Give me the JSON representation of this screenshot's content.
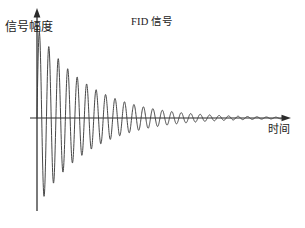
{
  "figure": {
    "title": "FID 信号",
    "background_color": "#ffffff",
    "line_color": "#3d3d3d",
    "axis_color": "#2b2b2b"
  },
  "axes": {
    "y_label": "信号幅度",
    "x_label": "时间",
    "x_arrow_icon": "arrow-right-icon",
    "y_arrow_icon": "arrow-up-icon"
  },
  "chart_data": {
    "type": "line",
    "title": "FID 信号",
    "xlabel": "时间",
    "ylabel": "信号幅度",
    "grid": false,
    "legend": null,
    "axis_origin_px": {
      "x": 37,
      "y": 118
    },
    "xlim": [
      0,
      26
    ],
    "ylim": [
      -1.05,
      1.05
    ],
    "model": {
      "form": "amplitude * exp(-t / tau) * sin(2*pi*t / period)",
      "amplitude": 1.0,
      "tau": 5.4,
      "period": 1.0,
      "t_start": 0,
      "t_end": 26,
      "samples": 1400
    },
    "x": [
      0.25,
      0.75,
      1.25,
      1.75,
      2.25,
      2.75,
      3.25,
      3.75,
      4.25,
      4.75,
      5.25,
      5.75,
      6.25,
      6.75,
      7.25,
      7.75,
      8.25,
      8.75,
      9.25,
      9.75,
      10.25,
      10.75,
      11.25,
      11.75,
      12.25,
      12.75,
      13.25,
      13.75,
      14.25,
      14.75,
      15.25,
      15.75,
      16.25,
      16.75,
      17.25,
      17.75,
      18.25,
      18.75,
      19.25,
      19.75,
      20.25,
      20.75,
      21.25,
      21.75,
      22.25,
      22.75,
      23.25,
      23.75,
      24.25,
      24.75,
      25.25,
      25.75
    ],
    "y": [
      0.955,
      -0.871,
      0.794,
      -0.724,
      0.661,
      -0.603,
      0.55,
      -0.501,
      0.457,
      -0.417,
      0.38,
      -0.347,
      0.317,
      -0.289,
      0.263,
      -0.24,
      0.219,
      -0.2,
      0.182,
      -0.166,
      0.152,
      -0.138,
      0.126,
      -0.115,
      0.105,
      -0.096,
      0.087,
      -0.08,
      0.073,
      -0.066,
      0.06,
      -0.055,
      0.05,
      -0.046,
      0.042,
      -0.038,
      0.035,
      -0.032,
      0.029,
      -0.026,
      0.024,
      -0.022,
      0.02,
      -0.018,
      0.016,
      -0.015,
      0.014,
      -0.013,
      0.012,
      -0.011,
      0.01,
      -0.009
    ]
  }
}
